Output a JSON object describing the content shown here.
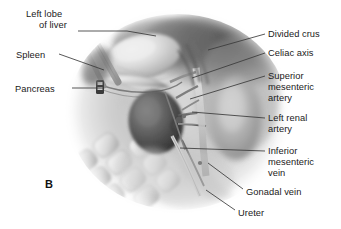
{
  "figure": {
    "letter": "B",
    "type": "medical-anatomical-illustration",
    "style": "grayscale airbrush rendering of retroperitoneal abdominal anatomy",
    "background_color": "#ffffff",
    "text_color": "#1a1a1a",
    "leader_line_color": "#3a3a3a"
  },
  "labels_left": [
    {
      "id": "left-lobe-of-liver",
      "line1": "Left lobe",
      "line2": "of liver"
    },
    {
      "id": "spleen",
      "line1": "Spleen"
    },
    {
      "id": "pancreas",
      "line1": "Pancreas"
    }
  ],
  "labels_right": [
    {
      "id": "divided-crus",
      "line1": "Divided crus"
    },
    {
      "id": "celiac-axis",
      "line1": "Celiac axis"
    },
    {
      "id": "superior-mesenteric-artery",
      "line1": "Superior",
      "line2": "mesenteric",
      "line3": "artery"
    },
    {
      "id": "left-renal-artery",
      "line1": "Left renal",
      "line2": "artery"
    },
    {
      "id": "inferior-mesenteric-vein",
      "line1": "Inferior",
      "line2": "mesenteric",
      "line3": "vein"
    },
    {
      "id": "gonadal-vein",
      "line1": "Gonadal vein"
    },
    {
      "id": "ureter",
      "line1": "Ureter"
    }
  ]
}
